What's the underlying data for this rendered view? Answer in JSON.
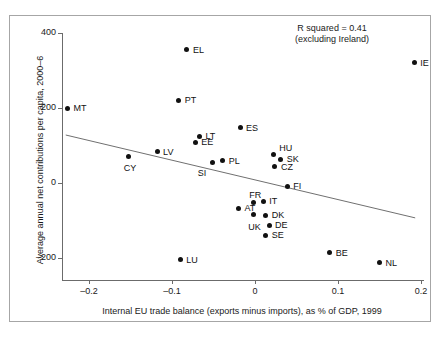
{
  "chart_data": {
    "type": "scatter",
    "title": "",
    "xlabel": "Internal EU trade balance (exports minus imports), as % of GDP, 1999",
    "ylabel": "Average annual net contributions per capita, 2000–6",
    "xlim": [
      -0.245,
      0.215
    ],
    "ylim": [
      -255,
      420
    ],
    "xticks": [
      -0.2,
      -0.1,
      0,
      0.1,
      0.2
    ],
    "xtick_labels": [
      "–0.2",
      "–0.1",
      "0",
      "0.1",
      "0.2"
    ],
    "yticks": [
      400,
      200,
      0,
      -200
    ],
    "ytick_labels": [
      "400",
      "200",
      "0",
      "–200"
    ],
    "grid": false,
    "legend": null,
    "annotations": [
      {
        "text_line_1": "R squared = 0.41",
        "text_line_2": "(excluding Ireland)"
      }
    ],
    "trendline": {
      "x_start": -0.228,
      "y_start": 128,
      "x_end": 0.193,
      "y_end": -93
    },
    "point_color": "#111111",
    "points": [
      {
        "label": "MT",
        "x": -0.226,
        "y": 200
      },
      {
        "label": "CY",
        "x": -0.152,
        "y": 72
      },
      {
        "label": "LV",
        "x": -0.118,
        "y": 83
      },
      {
        "label": "EL",
        "x": -0.082,
        "y": 355
      },
      {
        "label": "PT",
        "x": -0.092,
        "y": 221
      },
      {
        "label": "LU",
        "x": -0.09,
        "y": -205
      },
      {
        "label": "EE",
        "x": -0.072,
        "y": 109
      },
      {
        "label": "LT",
        "x": -0.067,
        "y": 125
      },
      {
        "label": "SI",
        "x": -0.051,
        "y": 56
      },
      {
        "label": "PL",
        "x": -0.039,
        "y": 59
      },
      {
        "label": "ES",
        "x": -0.018,
        "y": 147
      },
      {
        "label": "AT",
        "x": -0.02,
        "y": -67
      },
      {
        "label": "FR",
        "x": -0.002,
        "y": -51
      },
      {
        "label": "UK",
        "x": -0.002,
        "y": -85
      },
      {
        "label": "IT",
        "x": 0.01,
        "y": -48
      },
      {
        "label": "DK",
        "x": 0.013,
        "y": -86
      },
      {
        "label": "DE",
        "x": 0.017,
        "y": -112
      },
      {
        "label": "SE",
        "x": 0.013,
        "y": -139
      },
      {
        "label": "HU",
        "x": 0.022,
        "y": 75
      },
      {
        "label": "SK",
        "x": 0.031,
        "y": 64
      },
      {
        "label": "CZ",
        "x": 0.024,
        "y": 43
      },
      {
        "label": "FI",
        "x": 0.039,
        "y": -8
      },
      {
        "label": "BE",
        "x": 0.09,
        "y": -186
      },
      {
        "label": "NL",
        "x": 0.15,
        "y": -213
      },
      {
        "label": "IE",
        "x": 0.192,
        "y": 321
      }
    ],
    "label_offsets": {
      "MT": [
        6,
        -5
      ],
      "CY": [
        -5,
        7
      ],
      "LV": [
        6,
        -5
      ],
      "EL": [
        6,
        -5
      ],
      "PT": [
        6,
        -5
      ],
      "LU": [
        6,
        -5
      ],
      "EE": [
        6,
        -5
      ],
      "LT": [
        6,
        -5
      ],
      "SI": [
        -15,
        6
      ],
      "PL": [
        6,
        -5
      ],
      "ES": [
        6,
        -5
      ],
      "AT": [
        6,
        -5
      ],
      "FR": [
        -4,
        -12
      ],
      "UK": [
        -5,
        7
      ],
      "IT": [
        6,
        -5
      ],
      "DK": [
        6,
        -5
      ],
      "DE": [
        6,
        -5
      ],
      "SE": [
        6,
        -5
      ],
      "HU": [
        6,
        -12
      ],
      "SK": [
        6,
        -5
      ],
      "CZ": [
        6,
        -5
      ],
      "FI": [
        6,
        -5
      ],
      "BE": [
        6,
        -5
      ],
      "NL": [
        6,
        -5
      ],
      "IE": [
        6,
        -5
      ]
    }
  }
}
